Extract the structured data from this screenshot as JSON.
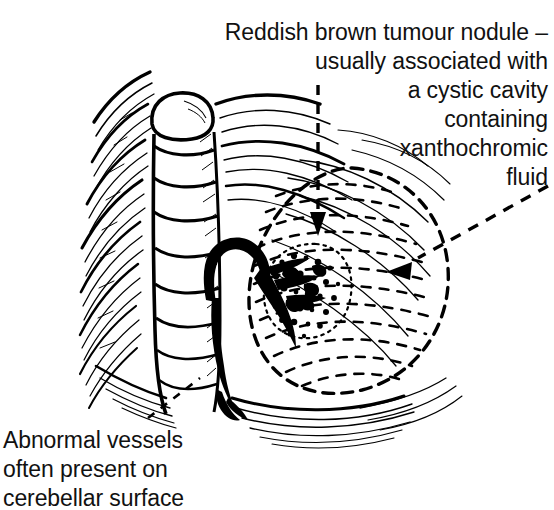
{
  "figure": {
    "background_color": "#ffffff",
    "ink_color": "#000000",
    "width": 554,
    "height": 502
  },
  "annotations": {
    "tumour_nodule": {
      "text": "Reddish brown tumour nodule –\nusually associated with\na cystic cavity\ncontaining\nxanthochromic\nfluid",
      "lines": [
        "Reddish brown tumour nodule –",
        "usually associated with",
        "a cystic cavity",
        "containing",
        "xanthochromic",
        "fluid"
      ],
      "align": "right",
      "leader_lines": [
        "vertical-dashed-arrow",
        "diagonal-dashed-arrow"
      ]
    },
    "abnormal_vessels": {
      "text": "Abnormal vessels\noften present on\ncerebellar surface",
      "lines": [
        "Abnormal vessels",
        "often present on",
        "cerebellar surface"
      ],
      "align": "left",
      "leader_lines": [
        "short-dashed-diagonal"
      ]
    }
  },
  "structures": {
    "vermis": {
      "label": "cerebellar vermis",
      "segments": 6
    },
    "left_hemisphere": {
      "label": "left cerebellar hemisphere folia"
    },
    "right_hemisphere": {
      "label": "right cerebellar hemisphere folia"
    },
    "cyst": {
      "label": "cystic cavity with xanthochromic fluid",
      "outline": "dashed-oval"
    },
    "nodule": {
      "label": "reddish brown tumour nodule",
      "outline": "dotted-circle",
      "fill": "dense-stipple"
    },
    "vessels": {
      "label": "abnormal surface vessels",
      "style": "thick-black-loop"
    }
  },
  "markers": {
    "arrow_down": {
      "x": 318,
      "y": 228,
      "points_to": "tumour nodule"
    },
    "arrow_left": {
      "x": 392,
      "y": 272,
      "points_to": "cystic cavity"
    }
  }
}
